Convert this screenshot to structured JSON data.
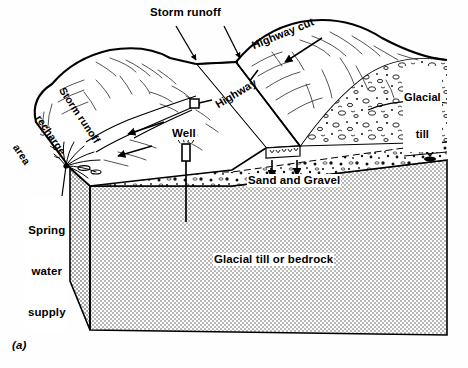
{
  "figure": {
    "label": "(a)",
    "type": "geologic block diagram"
  },
  "labels": {
    "storm_runoff": "Storm runoff",
    "highway_cut": "Highway cut",
    "highway": "Highway",
    "glacial_till_line1": "Glacial",
    "glacial_till_line2": "till",
    "recharge_line1": "Storm runoff",
    "recharge_line2": "recharge",
    "recharge_line3": "area",
    "well": "Well",
    "spring_line1": "Spring",
    "spring_line2": "water",
    "spring_line3": "supply",
    "sand_and_gravel": "Sand and Gravel",
    "glacial_till_or_bedrock": "Glacial till or bedrock"
  },
  "icons": {
    "water_table": "water-table-triangle-icon",
    "runoff_arrow": "flow-arrow-icon",
    "infiltration_arrow": "downward-infiltration-arrow-icon",
    "well_casing": "well-casing-icon",
    "spring_seep": "spring-seep-icon"
  },
  "colors": {
    "ink": "#000000",
    "paper": "#ffffff",
    "bedrock_fill": "#cfcfcf",
    "till_stipple": "#000000",
    "aquifer_fill": "#e8e8e8"
  },
  "counts": {
    "storm_runoff_arrows": 2,
    "infiltration_arrows": 2,
    "surface_flow_arrows": 3,
    "water_table_symbols": 1,
    "wells": 1
  }
}
